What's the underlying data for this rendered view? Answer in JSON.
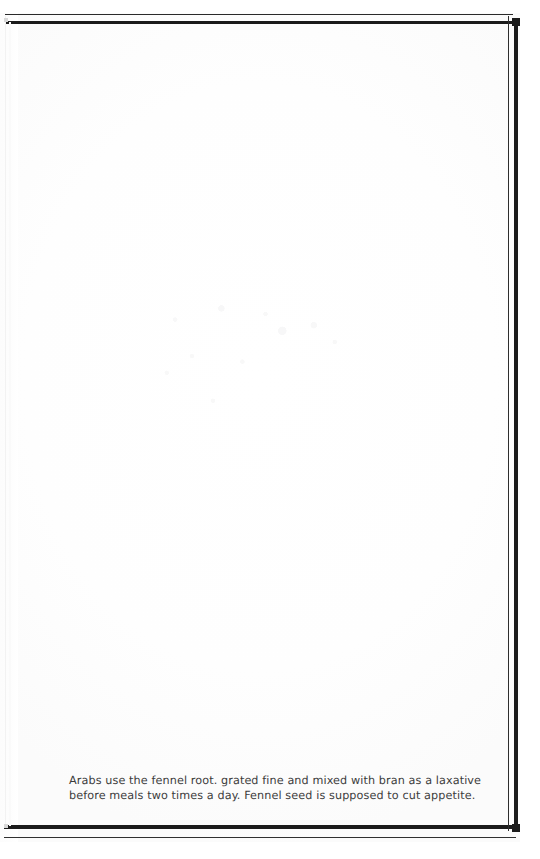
{
  "page": {
    "kind": "scanned-book-page",
    "background_color": "#fefefe",
    "ink_color": "#1b1b1b",
    "text_color": "#3b3b3b",
    "width": 540,
    "height": 859
  },
  "frame": {
    "style": "double-rule-border",
    "rule_color": "#1b1b1b",
    "left_rule_color_faded": "#f2f2f2",
    "corner_color": "#1b1b1b"
  },
  "body": {
    "is_blank": true,
    "content": ""
  },
  "footnote": {
    "lines": [
      "Arabs use the fennel root. grated fine and mixed with bran as a laxative",
      "before meals two times a day. Fennel seed is supposed to cut appetite."
    ],
    "line1": "Arabs use the fennel root. grated fine and mixed with bran as a laxative",
    "line2": "before meals two times a day. Fennel seed is supposed to cut appetite.",
    "full_text": "Arabs use the fennel root. grated fine and mixed with bran as a laxative before meals two times a day. Fennel seed is supposed to cut appetite."
  }
}
